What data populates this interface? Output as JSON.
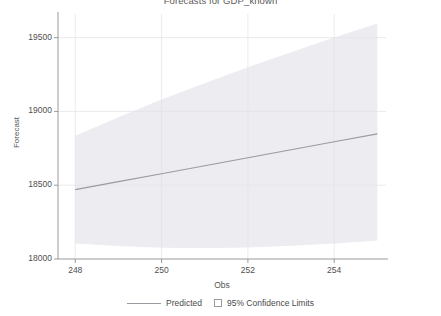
{
  "chart_data": {
    "type": "line",
    "title": "Forecasts for GDP_known",
    "xlabel": "Obs",
    "ylabel": "Forecast",
    "xlim": [
      247.6,
      255.2
    ],
    "ylim": [
      18000,
      19660
    ],
    "xticks": [
      248,
      250,
      252,
      254
    ],
    "xtick_labels": [
      "248",
      "250",
      "252",
      "254"
    ],
    "yticks": [
      18000,
      18500,
      19000,
      19500
    ],
    "ytick_labels": [
      "18000",
      "18500",
      "19000",
      "19500"
    ],
    "grid": true,
    "legend_position": "bottom",
    "legend": [
      {
        "label": "Predicted",
        "marker": "line",
        "color": "#9a9aa0"
      },
      {
        "label": "95% Confidence Limits",
        "marker": "square",
        "color": "#e9e9ee"
      }
    ],
    "x": [
      248,
      249,
      250,
      251,
      252,
      253,
      254,
      255
    ],
    "series": [
      {
        "name": "Predicted",
        "type": "line",
        "color": "#9a9aa0",
        "values": [
          18470,
          18524,
          18578,
          18632,
          18686,
          18740,
          18794,
          18848
        ]
      },
      {
        "name": "95% Upper Confidence Limit",
        "type": "band-upper",
        "color": "#e9e9ee",
        "values": [
          18835,
          18960,
          19080,
          19190,
          19300,
          19400,
          19500,
          19595
        ]
      },
      {
        "name": "95% Lower Confidence Limit",
        "type": "band-lower",
        "color": "#e9e9ee",
        "values": [
          18105,
          18088,
          18076,
          18074,
          18078,
          18090,
          18105,
          18125
        ]
      }
    ]
  },
  "plot_geometry": {
    "left": 58,
    "right": 386,
    "top": 14,
    "bottom": 259
  },
  "styling": {
    "band_fill": "#ececf1",
    "line_color": "#9a9aa0",
    "axis_color": "#8e8e92",
    "grid_color": "#e2e2e6",
    "background": "#ffffff"
  }
}
